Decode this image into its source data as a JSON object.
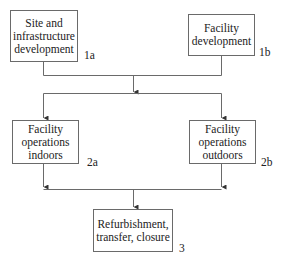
{
  "diagram": {
    "type": "flowchart",
    "nodes": [
      {
        "id": "1a",
        "label": "Site and infrastructure development",
        "lines": [
          "Site and",
          "infrastructure",
          "development"
        ],
        "tag": "1a"
      },
      {
        "id": "1b",
        "label": "Facility development",
        "lines": [
          "Facility",
          "development"
        ],
        "tag": "1b"
      },
      {
        "id": "2a",
        "label": "Facility operations indoors",
        "lines": [
          "Facility",
          "operations",
          "indoors"
        ],
        "tag": "2a"
      },
      {
        "id": "2b",
        "label": "Facility operations outdoors",
        "lines": [
          "Facility",
          "operations",
          "outdoors"
        ],
        "tag": "2b"
      },
      {
        "id": "3",
        "label": "Refurbishment, transfer, closure",
        "lines": [
          "Refurbishment,",
          "transfer, closure"
        ],
        "tag": "3"
      }
    ],
    "edges": [
      {
        "from": [
          "1a",
          "1b"
        ],
        "to": [
          "2a",
          "2b"
        ],
        "style": "merge-then-split"
      },
      {
        "from": [
          "2a",
          "2b"
        ],
        "to": [
          "3"
        ],
        "style": "merge"
      }
    ],
    "colors": {
      "line": "#6a6a6a",
      "box_border": "#6a6a6a",
      "text": "#222222"
    }
  }
}
